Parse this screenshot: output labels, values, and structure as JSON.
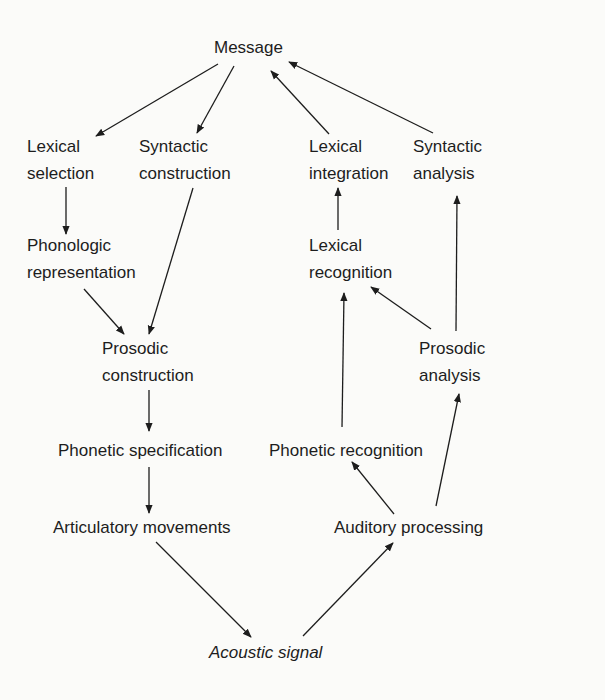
{
  "diagram": {
    "nodes": {
      "message": {
        "label": "Message"
      },
      "lexical_selection": {
        "line1": "Lexical",
        "line2": "selection"
      },
      "syntactic_construction": {
        "line1": "Syntactic",
        "line2": "construction"
      },
      "lexical_integration": {
        "line1": "Lexical",
        "line2": "integration"
      },
      "syntactic_analysis": {
        "line1": "Syntactic",
        "line2": "analysis"
      },
      "phonologic_representation": {
        "line1": "Phonologic",
        "line2": "representation"
      },
      "lexical_recognition": {
        "line1": "Lexical",
        "line2": "recognition"
      },
      "prosodic_construction": {
        "line1": "Prosodic",
        "line2": "construction"
      },
      "prosodic_analysis": {
        "line1": "Prosodic",
        "line2": "analysis"
      },
      "phonetic_specification": {
        "label": "Phonetic specification"
      },
      "phonetic_recognition": {
        "label": "Phonetic recognition"
      },
      "articulatory_movements": {
        "label": "Articulatory movements"
      },
      "auditory_processing": {
        "label": "Auditory processing"
      },
      "acoustic_signal": {
        "label": "Acoustic signal"
      }
    },
    "edges": [
      {
        "from": "Message",
        "to": "Lexical selection"
      },
      {
        "from": "Message",
        "to": "Syntactic construction"
      },
      {
        "from": "Lexical integration",
        "to": "Message"
      },
      {
        "from": "Syntactic analysis",
        "to": "Message"
      },
      {
        "from": "Lexical selection",
        "to": "Phonologic representation"
      },
      {
        "from": "Phonologic representation",
        "to": "Prosodic construction"
      },
      {
        "from": "Syntactic construction",
        "to": "Prosodic construction"
      },
      {
        "from": "Prosodic construction",
        "to": "Phonetic specification"
      },
      {
        "from": "Phonetic specification",
        "to": "Articulatory movements"
      },
      {
        "from": "Articulatory movements",
        "to": "Acoustic signal"
      },
      {
        "from": "Acoustic signal",
        "to": "Auditory processing"
      },
      {
        "from": "Auditory processing",
        "to": "Phonetic recognition"
      },
      {
        "from": "Auditory processing",
        "to": "Prosodic analysis"
      },
      {
        "from": "Phonetic recognition",
        "to": "Lexical recognition"
      },
      {
        "from": "Prosodic analysis",
        "to": "Lexical recognition"
      },
      {
        "from": "Prosodic analysis",
        "to": "Syntactic analysis"
      },
      {
        "from": "Lexical recognition",
        "to": "Lexical integration"
      }
    ],
    "colors": {
      "ink": "#1d1d1d",
      "background": "#fbfbf9"
    }
  }
}
